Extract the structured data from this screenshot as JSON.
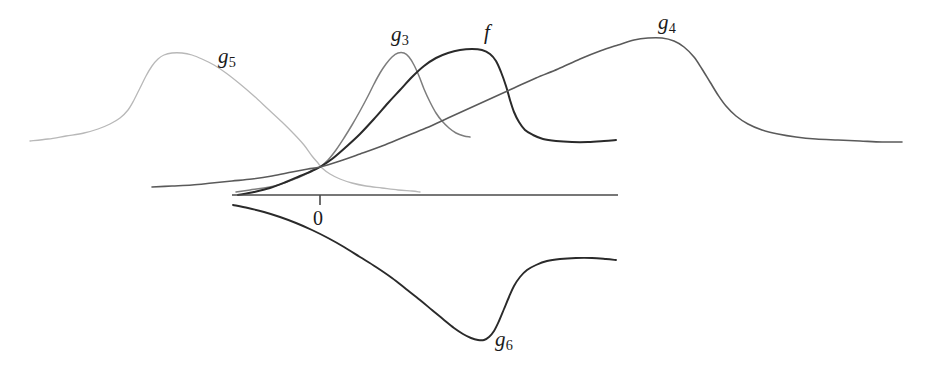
{
  "figure": {
    "title": "",
    "background_color": "#ffffff",
    "width": 930,
    "height": 374
  },
  "axis": {
    "origin_label": "0",
    "tick_x": 320,
    "baseline_y": 195,
    "x_start": 232,
    "x_end": 618,
    "color": "#4a4a4a"
  },
  "labels": {
    "g5": {
      "base": "g",
      "sub": "5"
    },
    "g3": {
      "base": "g",
      "sub": "3"
    },
    "f": {
      "base": "f",
      "sub": ""
    },
    "g4": {
      "base": "g",
      "sub": "4"
    },
    "g6": {
      "base": "g",
      "sub": "6"
    }
  },
  "chart_data": {
    "type": "line",
    "title": "",
    "xlabel": "",
    "ylabel": "",
    "grid": false,
    "legend": "inline-annotations",
    "xlim": [
      0,
      930
    ],
    "ylim": [
      374,
      0
    ],
    "annotations": [
      {
        "text": "0",
        "x": 320,
        "y": 215,
        "role": "origin-tick-label"
      }
    ],
    "convergence_point": {
      "x": 320,
      "y": 167
    },
    "series": [
      {
        "name": "g5",
        "label": "g_5",
        "color": "#b8b8b8",
        "width": 1.3,
        "label_pos": {
          "x": 218,
          "y": 46
        },
        "points": [
          [
            30,
            141
          ],
          [
            48,
            139
          ],
          [
            66,
            136
          ],
          [
            84,
            133
          ],
          [
            98,
            129
          ],
          [
            110,
            124
          ],
          [
            120,
            118
          ],
          [
            128,
            110
          ],
          [
            134,
            100
          ],
          [
            140,
            88
          ],
          [
            146,
            76
          ],
          [
            152,
            66
          ],
          [
            158,
            59
          ],
          [
            164,
            55
          ],
          [
            172,
            53
          ],
          [
            182,
            53
          ],
          [
            192,
            55
          ],
          [
            202,
            59
          ],
          [
            214,
            65
          ],
          [
            226,
            73
          ],
          [
            240,
            84
          ],
          [
            254,
            96
          ],
          [
            268,
            109
          ],
          [
            282,
            122
          ],
          [
            294,
            134
          ],
          [
            304,
            145
          ],
          [
            312,
            156
          ],
          [
            318,
            163
          ],
          [
            322,
            168
          ],
          [
            330,
            174
          ],
          [
            340,
            179
          ],
          [
            352,
            183
          ],
          [
            366,
            186
          ],
          [
            382,
            188
          ],
          [
            398,
            190
          ],
          [
            412,
            191
          ],
          [
            420,
            192
          ]
        ]
      },
      {
        "name": "g3",
        "label": "g_3",
        "color": "#7d7d7d",
        "width": 1.5,
        "label_pos": {
          "x": 391,
          "y": 24
        },
        "points": [
          [
            236,
            192
          ],
          [
            250,
            190
          ],
          [
            264,
            188
          ],
          [
            278,
            185
          ],
          [
            292,
            180
          ],
          [
            304,
            175
          ],
          [
            313,
            170
          ],
          [
            320,
            167
          ],
          [
            328,
            160
          ],
          [
            336,
            150
          ],
          [
            344,
            138
          ],
          [
            352,
            125
          ],
          [
            360,
            111
          ],
          [
            368,
            96
          ],
          [
            374,
            84
          ],
          [
            380,
            73
          ],
          [
            386,
            64
          ],
          [
            392,
            57
          ],
          [
            398,
            53
          ],
          [
            404,
            53
          ],
          [
            409,
            57
          ],
          [
            414,
            65
          ],
          [
            419,
            76
          ],
          [
            424,
            89
          ],
          [
            430,
            102
          ],
          [
            436,
            113
          ],
          [
            442,
            121
          ],
          [
            449,
            128
          ],
          [
            456,
            133
          ],
          [
            464,
            136
          ],
          [
            470,
            137
          ]
        ]
      },
      {
        "name": "f",
        "label": "f",
        "color": "#2a2a2a",
        "width": 2.0,
        "label_pos": {
          "x": 484,
          "y": 22
        },
        "points": [
          [
            238,
            195
          ],
          [
            254,
            192
          ],
          [
            270,
            188
          ],
          [
            286,
            182
          ],
          [
            300,
            176
          ],
          [
            312,
            171
          ],
          [
            320,
            167
          ],
          [
            332,
            159
          ],
          [
            346,
            147
          ],
          [
            360,
            134
          ],
          [
            374,
            119
          ],
          [
            388,
            103
          ],
          [
            400,
            90
          ],
          [
            412,
            77
          ],
          [
            424,
            66
          ],
          [
            436,
            58
          ],
          [
            448,
            53
          ],
          [
            460,
            50
          ],
          [
            472,
            49
          ],
          [
            482,
            50
          ],
          [
            490,
            54
          ],
          [
            496,
            61
          ],
          [
            501,
            72
          ],
          [
            506,
            86
          ],
          [
            510,
            100
          ],
          [
            514,
            112
          ],
          [
            519,
            122
          ],
          [
            525,
            130
          ],
          [
            533,
            135
          ],
          [
            543,
            139
          ],
          [
            556,
            141
          ],
          [
            572,
            142
          ],
          [
            588,
            142
          ],
          [
            604,
            141
          ],
          [
            616,
            140
          ]
        ]
      },
      {
        "name": "g4",
        "label": "g_4",
        "color": "#5a5a5a",
        "width": 1.6,
        "label_pos": {
          "x": 658,
          "y": 12
        },
        "points": [
          [
            152,
            187
          ],
          [
            172,
            186
          ],
          [
            192,
            185
          ],
          [
            212,
            183
          ],
          [
            232,
            181
          ],
          [
            252,
            179
          ],
          [
            272,
            176
          ],
          [
            292,
            172
          ],
          [
            308,
            169
          ],
          [
            320,
            167
          ],
          [
            340,
            161
          ],
          [
            360,
            154
          ],
          [
            382,
            146
          ],
          [
            404,
            137
          ],
          [
            426,
            128
          ],
          [
            448,
            118
          ],
          [
            470,
            108
          ],
          [
            492,
            98
          ],
          [
            514,
            88
          ],
          [
            536,
            78
          ],
          [
            558,
            69
          ],
          [
            580,
            59
          ],
          [
            600,
            51
          ],
          [
            618,
            45
          ],
          [
            634,
            40
          ],
          [
            648,
            38
          ],
          [
            662,
            38
          ],
          [
            674,
            41
          ],
          [
            684,
            47
          ],
          [
            694,
            57
          ],
          [
            702,
            69
          ],
          [
            710,
            82
          ],
          [
            718,
            95
          ],
          [
            726,
            106
          ],
          [
            736,
            116
          ],
          [
            748,
            124
          ],
          [
            762,
            130
          ],
          [
            778,
            134
          ],
          [
            796,
            137
          ],
          [
            816,
            139
          ],
          [
            838,
            140
          ],
          [
            860,
            141
          ],
          [
            882,
            142
          ],
          [
            902,
            142
          ]
        ]
      },
      {
        "name": "g6",
        "label": "g_6",
        "color": "#2a2a2a",
        "width": 1.9,
        "label_pos": {
          "x": 495,
          "y": 329
        },
        "points": [
          [
            233,
            205
          ],
          [
            248,
            208
          ],
          [
            264,
            212
          ],
          [
            280,
            217
          ],
          [
            296,
            223
          ],
          [
            312,
            230
          ],
          [
            328,
            238
          ],
          [
            344,
            247
          ],
          [
            360,
            257
          ],
          [
            376,
            267
          ],
          [
            392,
            278
          ],
          [
            406,
            289
          ],
          [
            420,
            300
          ],
          [
            432,
            310
          ],
          [
            444,
            320
          ],
          [
            454,
            328
          ],
          [
            463,
            334
          ],
          [
            471,
            338
          ],
          [
            478,
            340
          ],
          [
            484,
            340
          ],
          [
            489,
            337
          ],
          [
            494,
            331
          ],
          [
            499,
            321
          ],
          [
            504,
            309
          ],
          [
            509,
            297
          ],
          [
            514,
            286
          ],
          [
            520,
            277
          ],
          [
            527,
            270
          ],
          [
            536,
            265
          ],
          [
            547,
            261
          ],
          [
            560,
            259
          ],
          [
            576,
            258
          ],
          [
            592,
            258
          ],
          [
            606,
            259
          ],
          [
            616,
            260
          ]
        ]
      }
    ]
  }
}
